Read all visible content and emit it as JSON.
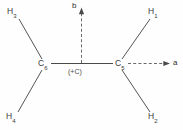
{
  "diagram": {
    "background_color": "#fefefe",
    "bond_color": "#4a4a4a",
    "dash_color": "#6a6a6a",
    "label_color": "#3a3a3a",
    "atoms": [
      {
        "id": "h3",
        "element": "H",
        "index": "3",
        "label": "H3",
        "x": 14,
        "y": 12
      },
      {
        "id": "h1",
        "element": "H",
        "index": "1",
        "label": "H1",
        "x": 152,
        "y": 12
      },
      {
        "id": "c6",
        "element": "C",
        "index": "6",
        "label": "C6",
        "x": 42,
        "y": 64
      },
      {
        "id": "c5",
        "element": "C",
        "index": "5",
        "label": "C5",
        "x": 120,
        "y": 64
      },
      {
        "id": "h4",
        "element": "H",
        "index": "4",
        "label": "H4",
        "x": 13,
        "y": 118
      },
      {
        "id": "h2",
        "element": "H",
        "index": "2",
        "label": "H2",
        "x": 152,
        "y": 118
      }
    ],
    "center_annotation": "(+C)",
    "vectors": [
      {
        "id": "vector-b",
        "label": "b",
        "direction": "up",
        "style": "dashed"
      },
      {
        "id": "vector-a",
        "label": "a",
        "direction": "right",
        "style": "dashed"
      }
    ],
    "labels": {
      "h3": "H",
      "h3_sub": "3",
      "h1": "H",
      "h1_sub": "1",
      "h4": "H",
      "h4_sub": "4",
      "h2": "H",
      "h2_sub": "2",
      "c6": "C",
      "c6_sub": "6",
      "c5": "C",
      "c5_sub": "5",
      "center": "(+C)",
      "vector_b": "b",
      "vector_a": "a"
    }
  }
}
